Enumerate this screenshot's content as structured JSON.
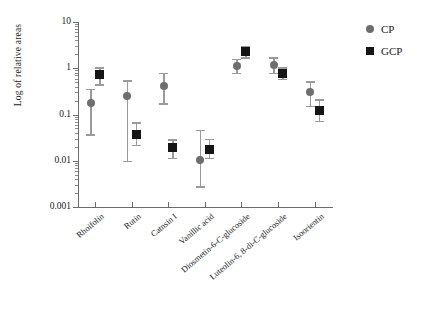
{
  "chart_data": {
    "type": "scatter",
    "title": "",
    "xlabel": "",
    "ylabel": "Log of relative areas",
    "yscale": "log",
    "ylim": [
      0.001,
      10
    ],
    "ytick_labels": [
      "10",
      "1",
      "0.1",
      "0.01",
      "0.001"
    ],
    "ytick_values": [
      10,
      1,
      0.1,
      0.01,
      0.001
    ],
    "grid": false,
    "legend_position": "right",
    "categories": [
      "Rhoifolin",
      "Rutin",
      "Catnsin I",
      "Vanillic acid",
      "Diosmetin-6-C-glucoside",
      "Luteolin-6, 8-di-C-glucoside",
      "Isoorientin"
    ],
    "series": [
      {
        "name": "CP",
        "marker": "circle",
        "color": "#6e6e6e",
        "values": [
          0.18,
          0.25,
          0.42,
          0.0105,
          1.1,
          1.2,
          0.3
        ],
        "err_low": [
          0.037,
          0.01,
          0.175,
          0.0028,
          0.8,
          0.8,
          0.155
        ],
        "err_high": [
          0.36,
          0.55,
          0.8,
          0.047,
          1.6,
          1.75,
          0.52
        ]
      },
      {
        "name": "GCP",
        "marker": "square",
        "color": "#151515",
        "values": [
          0.72,
          0.037,
          0.019,
          0.0175,
          2.3,
          0.78,
          0.125
        ],
        "err_low": [
          0.45,
          0.022,
          0.0115,
          0.0115,
          1.75,
          0.6,
          0.073
        ],
        "err_high": [
          1.05,
          0.068,
          0.029,
          0.03,
          3.1,
          1.05,
          0.215
        ]
      }
    ]
  },
  "legend": {
    "entries": [
      {
        "label": "CP",
        "marker": "circle"
      },
      {
        "label": "GCP",
        "marker": "square"
      }
    ]
  },
  "axes": {
    "y_title": "Log of relative areas"
  }
}
